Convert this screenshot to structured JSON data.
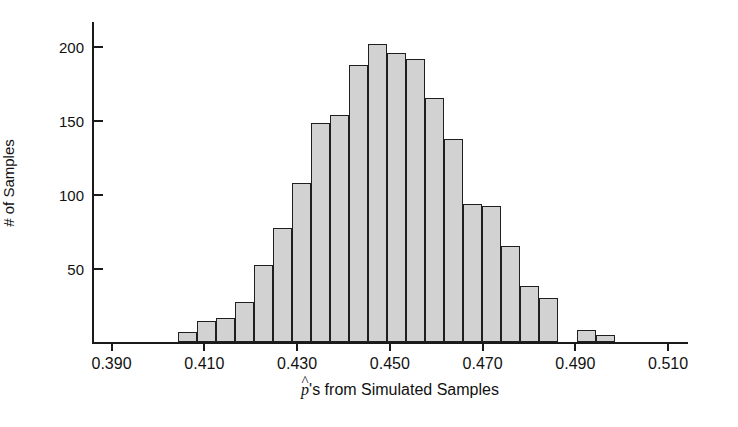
{
  "chart_data": {
    "type": "bar",
    "title": "",
    "subtitle": "",
    "xlabel": "p̂'s from Simulated Samples",
    "xlabel_parts": {
      "symbol": "p",
      "accent": "^",
      "rest": "'s from Simulated Samples"
    },
    "ylabel": "# of Samples",
    "xlim": [
      0.386,
      0.5145
    ],
    "ylim": [
      0,
      216
    ],
    "grid": false,
    "legend": null,
    "bin_width": 0.0041,
    "xticks": [
      0.39,
      0.41,
      0.43,
      0.45,
      0.47,
      0.49,
      0.51
    ],
    "xtick_labels": [
      "0.390",
      "0.410",
      "0.430",
      "0.450",
      "0.470",
      "0.490",
      "0.510"
    ],
    "yticks": [
      50,
      100,
      150,
      200
    ],
    "ytick_labels": [
      "50",
      "100",
      "150",
      "200"
    ],
    "bar_fill": "#d2d2d2",
    "bar_stroke": "#1f1f1f",
    "bins": [
      {
        "left": 0.4045,
        "right": 0.4086,
        "center": 0.4066,
        "count": 7
      },
      {
        "left": 0.4086,
        "right": 0.4127,
        "center": 0.4107,
        "count": 14
      },
      {
        "left": 0.4127,
        "right": 0.4168,
        "center": 0.4148,
        "count": 16
      },
      {
        "left": 0.4168,
        "right": 0.4209,
        "center": 0.4189,
        "count": 27
      },
      {
        "left": 0.4209,
        "right": 0.425,
        "center": 0.423,
        "count": 52
      },
      {
        "left": 0.425,
        "right": 0.4291,
        "center": 0.4271,
        "count": 77
      },
      {
        "left": 0.4291,
        "right": 0.4332,
        "center": 0.4312,
        "count": 107
      },
      {
        "left": 0.4332,
        "right": 0.4373,
        "center": 0.4353,
        "count": 148
      },
      {
        "left": 0.4373,
        "right": 0.4414,
        "center": 0.4394,
        "count": 153
      },
      {
        "left": 0.4414,
        "right": 0.4455,
        "center": 0.4435,
        "count": 187
      },
      {
        "left": 0.4455,
        "right": 0.4496,
        "center": 0.4476,
        "count": 201
      },
      {
        "left": 0.4496,
        "right": 0.4537,
        "center": 0.4517,
        "count": 195
      },
      {
        "left": 0.4537,
        "right": 0.4578,
        "center": 0.4558,
        "count": 191
      },
      {
        "left": 0.4578,
        "right": 0.4619,
        "center": 0.4599,
        "count": 165
      },
      {
        "left": 0.4619,
        "right": 0.466,
        "center": 0.464,
        "count": 137
      },
      {
        "left": 0.466,
        "right": 0.4701,
        "center": 0.4681,
        "count": 93
      },
      {
        "left": 0.4701,
        "right": 0.4742,
        "center": 0.4722,
        "count": 92
      },
      {
        "left": 0.4742,
        "right": 0.4783,
        "center": 0.4763,
        "count": 65
      },
      {
        "left": 0.4783,
        "right": 0.4824,
        "center": 0.4804,
        "count": 38
      },
      {
        "left": 0.4824,
        "right": 0.4865,
        "center": 0.4845,
        "count": 30
      },
      {
        "left": 0.4906,
        "right": 0.4947,
        "center": 0.4927,
        "count": 8
      },
      {
        "left": 0.4947,
        "right": 0.4988,
        "center": 0.4968,
        "count": 5
      }
    ]
  }
}
